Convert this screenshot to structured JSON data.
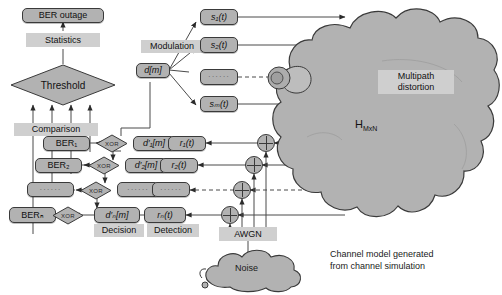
{
  "diagram": {
    "colors": {
      "node_fill": "#b2b2b2",
      "chip_fill": "#cfcfcf",
      "stroke": "#3a3a3a",
      "cloud_fill": "#b2b2b2",
      "background": "#ffffff"
    },
    "nodes": {
      "ber_outage": "BER outage",
      "threshold": "Threshold",
      "d_m": "d[m]",
      "s1": "s₁(t)",
      "s2": "s₂(t)",
      "s_dots": "······",
      "sM": "sₘ(t)",
      "r1": "r₁(t)",
      "r2": "r₂(t)",
      "r_dots": "······",
      "rN": "rₙ(t)",
      "dp1": "d′₁[m]",
      "dp2": "d′₂[m]",
      "dp_dots": "······",
      "dpN": "d′ₙ[m]",
      "ber1": "BER₁",
      "ber2": "BER₂",
      "ber_dots": "······",
      "berN": "BERₙ",
      "xor": "XOR"
    },
    "labels": {
      "statistics": "Statistics",
      "comparison": "Comparison",
      "modulation": "Modulation",
      "decision": "Decision",
      "detection": "Detection",
      "awgn": "AWGN",
      "noise": "Noise",
      "multipath": "Multipath\ndistortion",
      "h_matrix": "H",
      "h_matrix_sub": "MxN",
      "caption": "Channel model generated\nfrom channel simulation"
    }
  }
}
